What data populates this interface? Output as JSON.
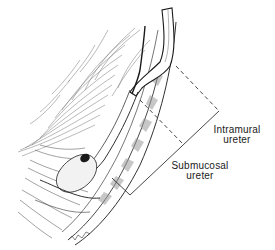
{
  "figure": {
    "type": "anatomical-illustration",
    "style": "black-and-white pen line drawing"
  },
  "labels": {
    "intramural": {
      "line1": "Intramural",
      "line2": "ureter"
    },
    "submucosal": {
      "line1": "Submucosal",
      "line2": "ureter"
    }
  },
  "colors": {
    "ink": "#1a1a1a",
    "background": "#ffffff",
    "shade": "#8a8a8a"
  }
}
